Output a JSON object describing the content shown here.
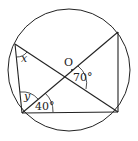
{
  "diagram": {
    "type": "circle-geometry",
    "circle": {
      "cx": 69,
      "cy": 70,
      "r": 61
    },
    "points": {
      "A": [
        15,
        44
      ],
      "B": [
        22,
        113
      ],
      "C": [
        118,
        112
      ],
      "D": [
        118,
        32
      ]
    },
    "labels": {
      "center": "O",
      "angle_x": "x",
      "angle_y": "y",
      "angle_40": "40°",
      "angle_70": "70°"
    },
    "colors": {
      "stroke": "#222222",
      "background": "#ffffff"
    }
  }
}
